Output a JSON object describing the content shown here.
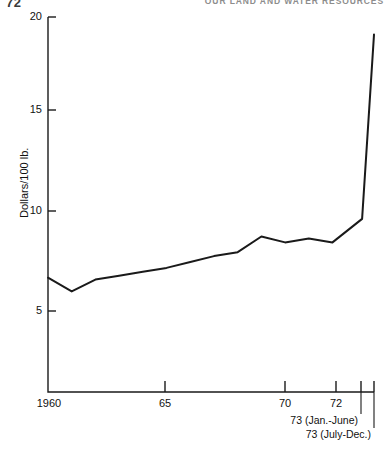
{
  "running_head": {
    "page_number": "72",
    "title": "OUR LAND AND WATER RESOURCES"
  },
  "chart_data": {
    "type": "line",
    "title": "",
    "subtitle": "",
    "xlabel": "",
    "ylabel": "Dollars/100 lb.",
    "ylim": [
      0,
      20
    ],
    "yticks": [
      5,
      10,
      15,
      20
    ],
    "ytick_labels": [
      "5",
      "10",
      "15",
      "20"
    ],
    "xlim": [
      1960,
      1973.75
    ],
    "xticks": [
      1960,
      1965,
      1970,
      1972,
      1973.25,
      1973.75
    ],
    "xtick_labels": [
      "1960",
      "65",
      "70",
      "72",
      "",
      ""
    ],
    "grid": false,
    "legend": null,
    "x": [
      1960,
      1961,
      1962,
      1963,
      1964,
      1965,
      1966,
      1967,
      1968,
      1969,
      1970,
      1971,
      1972,
      1973.25,
      1973.75
    ],
    "values": [
      6.7,
      6.0,
      6.6,
      6.8,
      7.0,
      7.2,
      7.5,
      7.8,
      8.0,
      8.8,
      8.5,
      8.7,
      8.5,
      9.7,
      19.1
    ],
    "series": [
      {
        "name": "Price",
        "values": [
          6.7,
          6.0,
          6.6,
          6.8,
          7.0,
          7.2,
          7.5,
          7.8,
          8.0,
          8.8,
          8.5,
          8.7,
          8.5,
          9.7,
          19.1
        ]
      }
    ],
    "annotations": [
      {
        "text": "73 (Jan.-June)",
        "x": 1973.25
      },
      {
        "text": "73 (July-Dec.)",
        "x": 1973.75
      }
    ]
  }
}
